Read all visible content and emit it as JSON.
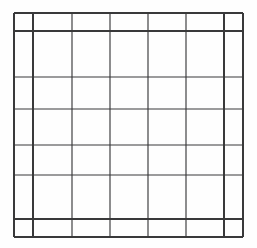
{
  "document": {
    "type": "blank-table-grid",
    "title": "",
    "background_color": "#fefefe",
    "line_color": "#39393a",
    "canvas": {
      "width": 257,
      "height": 248
    }
  },
  "table": {
    "name": "empty-data-table",
    "caption": "",
    "row_count": 7,
    "column_count": 7,
    "cells_empty": true,
    "header_row_label": "",
    "footer_row_label": "",
    "column_headers": [
      "",
      "",
      "",
      "",
      "",
      "",
      ""
    ],
    "rows": [
      {
        "cells": [
          "",
          "",
          "",
          "",
          "",
          "",
          ""
        ]
      },
      {
        "cells": [
          "",
          "",
          "",
          "",
          "",
          "",
          ""
        ]
      },
      {
        "cells": [
          "",
          "",
          "",
          "",
          "",
          "",
          ""
        ]
      },
      {
        "cells": [
          "",
          "",
          "",
          "",
          "",
          "",
          ""
        ]
      },
      {
        "cells": [
          "",
          "",
          "",
          "",
          "",
          "",
          ""
        ]
      },
      {
        "cells": [
          "",
          "",
          "",
          "",
          "",
          "",
          ""
        ]
      },
      {
        "cells": [
          "",
          "",
          "",
          "",
          "",
          "",
          ""
        ]
      }
    ],
    "geometry": {
      "x_min": 14,
      "x_max": 243,
      "y_min": 13,
      "y_max": 237,
      "vertical_lines": [
        {
          "x": 14,
          "weight": "heavy"
        },
        {
          "x": 33,
          "weight": "heavy"
        },
        {
          "x": 72,
          "weight": "medium"
        },
        {
          "x": 110,
          "weight": "medium"
        },
        {
          "x": 148,
          "weight": "medium"
        },
        {
          "x": 186,
          "weight": "medium"
        },
        {
          "x": 224,
          "weight": "heavy"
        },
        {
          "x": 243,
          "weight": "heavy"
        }
      ],
      "horizontal_lines": [
        {
          "y": 13,
          "weight": "heavy"
        },
        {
          "y": 31,
          "weight": "heavy"
        },
        {
          "y": 77,
          "weight": "medium"
        },
        {
          "y": 109,
          "weight": "medium"
        },
        {
          "y": 145,
          "weight": "medium"
        },
        {
          "y": 175,
          "weight": "medium"
        },
        {
          "y": 219,
          "weight": "heavy"
        },
        {
          "y": 237,
          "weight": "heavy"
        }
      ]
    }
  }
}
